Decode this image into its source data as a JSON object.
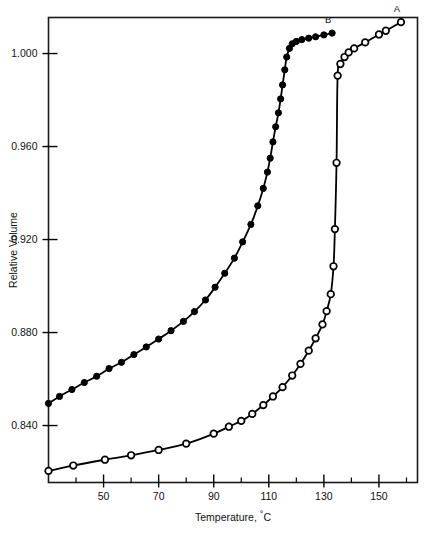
{
  "chart_data": {
    "type": "line",
    "title": "",
    "xlabel": "Temperature, °C",
    "ylabel": "Relative Volume",
    "xlim": [
      30,
      164
    ],
    "ylim": [
      0.8155,
      1.0155
    ],
    "grid": false,
    "legend_position": "inline-end-of-curve",
    "x_ticks_major": [
      50,
      70,
      90,
      110,
      130,
      150
    ],
    "x_tick_labels": [
      "50",
      "70",
      "90",
      "110",
      "130",
      "150"
    ],
    "x_ticks_minor": [
      40,
      60,
      80,
      100,
      120,
      140,
      160
    ],
    "y_ticks_major": [
      0.84,
      0.88,
      0.92,
      0.96,
      1.0
    ],
    "y_tick_labels": [
      "0.840",
      "0.880",
      "0.920",
      "0.960",
      "1.000"
    ],
    "series": [
      {
        "name": "A",
        "label": "A",
        "marker": "open-circle",
        "marker_fill": "#ffffff",
        "color": "#000000",
        "points": [
          [
            30.0,
            0.8205
          ],
          [
            39.0,
            0.8228
          ],
          [
            50.5,
            0.8253
          ],
          [
            60.0,
            0.8272
          ],
          [
            70.0,
            0.8295
          ],
          [
            80.0,
            0.8322
          ],
          [
            90.0,
            0.8365
          ],
          [
            95.5,
            0.8395
          ],
          [
            100.0,
            0.842
          ],
          [
            104.0,
            0.845
          ],
          [
            108.0,
            0.8488
          ],
          [
            111.5,
            0.8525
          ],
          [
            115.0,
            0.8565
          ],
          [
            118.5,
            0.8615
          ],
          [
            121.5,
            0.8665
          ],
          [
            124.5,
            0.8722
          ],
          [
            127.0,
            0.8775
          ],
          [
            129.5,
            0.8835
          ],
          [
            131.0,
            0.8892
          ],
          [
            132.5,
            0.8965
          ],
          [
            133.5,
            0.9085
          ],
          [
            134.0,
            0.9245
          ],
          [
            134.6,
            0.953
          ],
          [
            135.0,
            0.9905
          ],
          [
            136.0,
            0.9955
          ],
          [
            137.5,
            0.9985
          ],
          [
            139.0,
            1.0005
          ],
          [
            141.0,
            1.0022
          ],
          [
            145.0,
            1.0048
          ],
          [
            150.0,
            1.0082
          ],
          [
            152.5,
            1.0098
          ],
          [
            158.0,
            1.0135
          ]
        ]
      },
      {
        "name": "B",
        "label": "B",
        "marker": "filled-circle",
        "marker_fill": "#000000",
        "color": "#000000",
        "points": [
          [
            30.0,
            0.8495
          ],
          [
            34.0,
            0.8525
          ],
          [
            38.5,
            0.8555
          ],
          [
            43.0,
            0.8585
          ],
          [
            47.5,
            0.8612
          ],
          [
            52.0,
            0.8645
          ],
          [
            56.5,
            0.8672
          ],
          [
            61.0,
            0.8705
          ],
          [
            65.5,
            0.8738
          ],
          [
            70.0,
            0.8772
          ],
          [
            74.5,
            0.8808
          ],
          [
            79.0,
            0.8848
          ],
          [
            83.0,
            0.889
          ],
          [
            87.0,
            0.894
          ],
          [
            90.5,
            0.8995
          ],
          [
            94.0,
            0.9055
          ],
          [
            97.5,
            0.912
          ],
          [
            100.5,
            0.919
          ],
          [
            103.5,
            0.9265
          ],
          [
            106.0,
            0.9345
          ],
          [
            108.0,
            0.942
          ],
          [
            109.5,
            0.949
          ],
          [
            110.5,
            0.955
          ],
          [
            111.5,
            0.962
          ],
          [
            112.5,
            0.9685
          ],
          [
            113.5,
            0.9745
          ],
          [
            114.3,
            0.9805
          ],
          [
            115.0,
            0.9865
          ],
          [
            115.8,
            0.993
          ],
          [
            116.5,
            0.9985
          ],
          [
            117.5,
            1.0022
          ],
          [
            118.5,
            1.0042
          ],
          [
            120.0,
            1.0052
          ],
          [
            122.0,
            1.006
          ],
          [
            124.5,
            1.0066
          ],
          [
            127.0,
            1.0072
          ],
          [
            130.0,
            1.008
          ],
          [
            133.0,
            1.0088
          ]
        ]
      }
    ]
  },
  "axes": {
    "y_title": "Relative Volume",
    "x_title": "Temperature, °C",
    "x_title_parts": {
      "main": "Temperature, ",
      "degree": "°",
      "unit": "C"
    }
  },
  "labels": {
    "curve_a": "A",
    "curve_b": "B"
  },
  "colors": {
    "ink": "#000000",
    "background": "#ffffff",
    "frame": "#1a1a1a"
  }
}
